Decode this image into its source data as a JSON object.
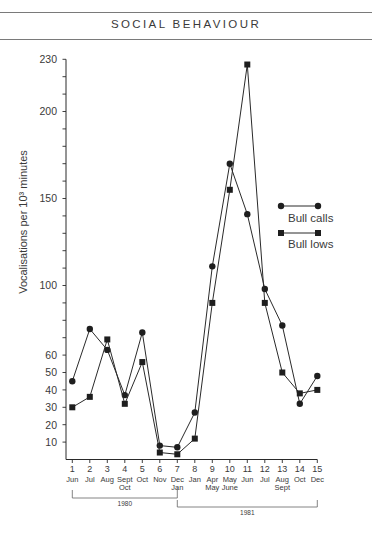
{
  "header": {
    "title": "SOCIAL BEHAVIOUR"
  },
  "chart_data": {
    "type": "line",
    "title": "",
    "xlabel": "",
    "ylabel": "Vocalisations per 10³ minutes",
    "xlim": [
      1,
      15
    ],
    "ylim": [
      0,
      230
    ],
    "grid": false,
    "legend": "right",
    "x": [
      1,
      2,
      3,
      4,
      5,
      6,
      7,
      8,
      9,
      10,
      11,
      12,
      13,
      14,
      15
    ],
    "x_tick_labels": [
      {
        "num": "1",
        "months": [
          "Jun"
        ]
      },
      {
        "num": "2",
        "months": [
          "Jul"
        ]
      },
      {
        "num": "3",
        "months": [
          "Aug"
        ]
      },
      {
        "num": "4",
        "months": [
          "Sept",
          "Oct"
        ]
      },
      {
        "num": "5",
        "months": [
          "Oct"
        ]
      },
      {
        "num": "6",
        "months": [
          "Nov"
        ]
      },
      {
        "num": "7",
        "months": [
          "Dec",
          "Jan"
        ]
      },
      {
        "num": "8",
        "months": [
          "Jan"
        ]
      },
      {
        "num": "9",
        "months": [
          "Apr",
          "May"
        ]
      },
      {
        "num": "10",
        "months": [
          "May",
          "June"
        ]
      },
      {
        "num": "11",
        "months": [
          "Jun"
        ]
      },
      {
        "num": "12",
        "months": [
          "Jul"
        ]
      },
      {
        "num": "13",
        "months": [
          "Aug",
          "Sept"
        ]
      },
      {
        "num": "14",
        "months": [
          "Oct"
        ]
      },
      {
        "num": "15",
        "months": [
          "Dec"
        ]
      }
    ],
    "year_groups": [
      {
        "label": "1980",
        "from": 1,
        "to": 7
      },
      {
        "label": "1981",
        "from": 7,
        "to": 15
      }
    ],
    "y_tick_labels": [
      10,
      20,
      30,
      40,
      50,
      60,
      100,
      150,
      200,
      230
    ],
    "y_minor_tick_step": 10,
    "series": [
      {
        "name": "Bull calls",
        "marker": "circle",
        "values": [
          45,
          75,
          63,
          37,
          73,
          8,
          7,
          27,
          111,
          170,
          141,
          98,
          77,
          32,
          48
        ]
      },
      {
        "name": "Bull lows",
        "marker": "square",
        "values": [
          30,
          36,
          69,
          32,
          56,
          4,
          3,
          12,
          90,
          155,
          227,
          90,
          50,
          38,
          40
        ]
      }
    ]
  }
}
